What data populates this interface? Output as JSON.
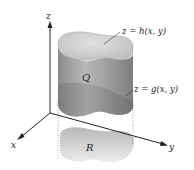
{
  "diagram": {
    "type": "3d-solid-region",
    "axes": {
      "x_label": "x",
      "y_label": "y",
      "z_label": "z"
    },
    "labels": {
      "top_surface": "z = h(x, y)",
      "bottom_surface": "z = g(x, y)",
      "solid": "Q",
      "region": "R"
    },
    "colors": {
      "solid_side": "#9a9a9a",
      "solid_top": "#d0d0d0",
      "region": "#c8c8c8",
      "axis": "#222222"
    }
  }
}
